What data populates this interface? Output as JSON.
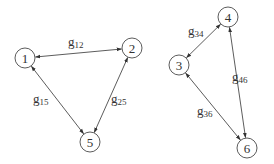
{
  "diagram": {
    "type": "graph",
    "directed": "bidirectional",
    "colors": {
      "stroke": "#4a4a4a",
      "text": "#333333",
      "background": "#ffffff"
    },
    "node_radius": 10,
    "nodes": [
      {
        "id": "1",
        "label": "1",
        "x": 25,
        "y": 58
      },
      {
        "id": "2",
        "label": "2",
        "x": 132,
        "y": 48
      },
      {
        "id": "5",
        "label": "5",
        "x": 90,
        "y": 142
      },
      {
        "id": "3",
        "label": "3",
        "x": 179,
        "y": 65
      },
      {
        "id": "4",
        "label": "4",
        "x": 228,
        "y": 17
      },
      {
        "id": "6",
        "label": "6",
        "x": 247,
        "y": 148
      }
    ],
    "edges": [
      {
        "id": "g12",
        "from": "1",
        "to": "2",
        "label_main": "g",
        "label_sub": "12",
        "lx": 68,
        "ly": 46
      },
      {
        "id": "g15",
        "from": "1",
        "to": "5",
        "label_main": "g",
        "label_sub": "15",
        "lx": 33,
        "ly": 103
      },
      {
        "id": "g25",
        "from": "2",
        "to": "5",
        "label_main": "g",
        "label_sub": "25",
        "lx": 111,
        "ly": 103
      },
      {
        "id": "g34",
        "from": "3",
        "to": "4",
        "label_main": "g",
        "label_sub": "34",
        "lx": 188,
        "ly": 35
      },
      {
        "id": "g46",
        "from": "4",
        "to": "6",
        "label_main": "g",
        "label_sub": "46",
        "lx": 232,
        "ly": 81
      },
      {
        "id": "g36",
        "from": "3",
        "to": "6",
        "label_main": "g",
        "label_sub": "36",
        "lx": 197,
        "ly": 115
      }
    ]
  }
}
